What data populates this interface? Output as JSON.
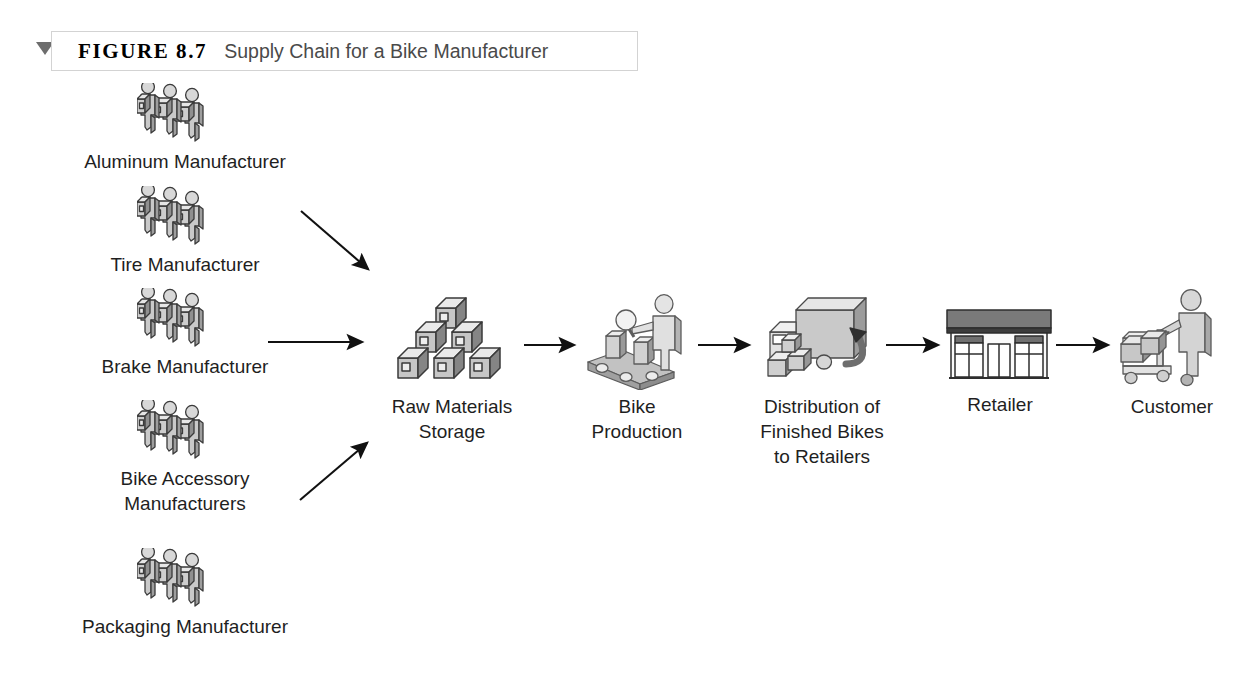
{
  "figure": {
    "marker_icon": "triangle-down-icon",
    "label": "FIGURE 8.7",
    "title": "Supply Chain for a Bike Manufacturer"
  },
  "colors": {
    "background": "#ffffff",
    "caption_border": "#d3d3d3",
    "text": "#1f1f1f",
    "title_text": "#4a4a4a",
    "arrow": "#111111",
    "icon_light": "#e8e8e8",
    "icon_mid": "#b9b9b9",
    "icon_dark": "#8a8a8a",
    "icon_outline": "#3a3a3a"
  },
  "suppliers": [
    {
      "id": "aluminum-manufacturer",
      "label": "Aluminum Manufacturer",
      "icon": "three-workers-carrying-boxes-icon"
    },
    {
      "id": "tire-manufacturer",
      "label": "Tire Manufacturer",
      "icon": "three-workers-carrying-boxes-icon"
    },
    {
      "id": "brake-manufacturer",
      "label": "Brake Manufacturer",
      "icon": "three-workers-carrying-boxes-icon"
    },
    {
      "id": "bike-accessory-manufacturers",
      "label": "Bike Accessory\nManufacturers",
      "icon": "three-workers-carrying-boxes-icon"
    },
    {
      "id": "packaging-manufacturer",
      "label": "Packaging Manufacturer",
      "icon": "three-workers-carrying-boxes-icon"
    }
  ],
  "chain": [
    {
      "id": "raw-materials-storage",
      "label": "Raw Materials\nStorage",
      "icon": "stacked-boxes-pyramid-icon"
    },
    {
      "id": "bike-production",
      "label": "Bike\nProduction",
      "icon": "conveyor-belt-worker-icon"
    },
    {
      "id": "distribution",
      "label": "Distribution of\nFinished Bikes\nto Retailers",
      "icon": "delivery-truck-loading-icon"
    },
    {
      "id": "retailer",
      "label": "Retailer",
      "icon": "storefront-icon"
    },
    {
      "id": "customer",
      "label": "Customer",
      "icon": "customer-pushing-cart-icon"
    }
  ],
  "arrows": [
    {
      "id": "arrow-suppliers-top-to-storage",
      "type": "diagonal-down-right"
    },
    {
      "id": "arrow-suppliers-middle-to-storage",
      "type": "horizontal-right"
    },
    {
      "id": "arrow-suppliers-bottom-to-storage",
      "type": "diagonal-up-right"
    },
    {
      "id": "arrow-storage-to-production",
      "type": "horizontal-right"
    },
    {
      "id": "arrow-production-to-distribution",
      "type": "horizontal-right"
    },
    {
      "id": "arrow-distribution-to-retailer",
      "type": "horizontal-right"
    },
    {
      "id": "arrow-retailer-to-customer",
      "type": "horizontal-right"
    }
  ]
}
